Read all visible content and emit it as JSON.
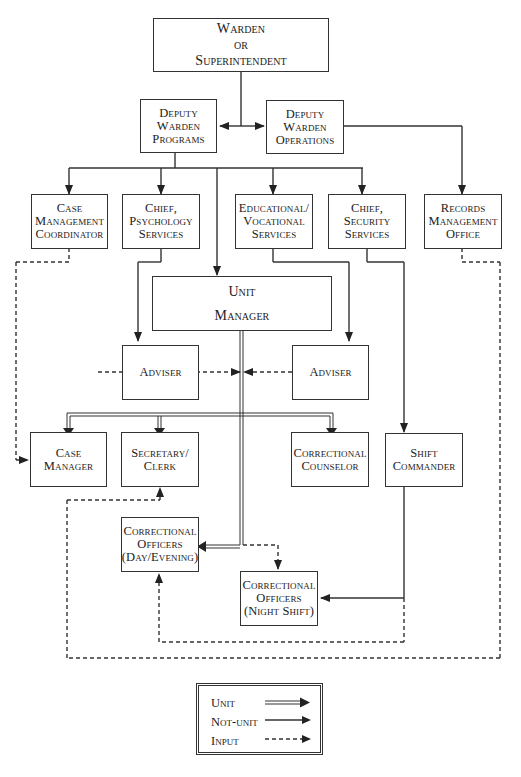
{
  "nodes": {
    "warden": {
      "lines": [
        "Warden",
        "or",
        "Superintendent"
      ]
    },
    "dw_programs": {
      "lines": [
        "Deputy",
        "Warden",
        "Programs"
      ]
    },
    "dw_operations": {
      "lines": [
        "Deputy",
        "Warden",
        "Operations"
      ]
    },
    "case_mgmt_coord": {
      "lines": [
        "Case",
        "Management",
        "Coordinator"
      ]
    },
    "chief_psych": {
      "lines": [
        "Chief,",
        "Psychology",
        "Services"
      ]
    },
    "edu_voc": {
      "lines": [
        "Educational/",
        "Vocational",
        "Services"
      ]
    },
    "chief_security": {
      "lines": [
        "Chief,",
        "Security",
        "Services"
      ]
    },
    "records": {
      "lines": [
        "Records",
        "Management",
        "Office"
      ]
    },
    "unit_manager": {
      "lines": [
        "Unit",
        "Manager"
      ]
    },
    "adviser_left": {
      "lines": [
        "Adviser"
      ]
    },
    "adviser_right": {
      "lines": [
        "Adviser"
      ]
    },
    "case_manager": {
      "lines": [
        "Case",
        "Manager"
      ]
    },
    "secretary": {
      "lines": [
        "Secretary/",
        "Clerk"
      ]
    },
    "counselor": {
      "lines": [
        "Correctional",
        "Counselor"
      ]
    },
    "shift_commander": {
      "lines": [
        "Shift",
        "Commander"
      ]
    },
    "co_day": {
      "lines": [
        "Correctional",
        "Officers",
        "(Day/Evening)"
      ]
    },
    "co_night": {
      "lines": [
        "Correctional",
        "Officers",
        "(Night Shift)"
      ]
    }
  },
  "legend": {
    "unit": "Unit",
    "not_unit": "Not-unit",
    "input": "Input"
  },
  "colors": {
    "line": "#333333",
    "background": "#ffffff"
  }
}
